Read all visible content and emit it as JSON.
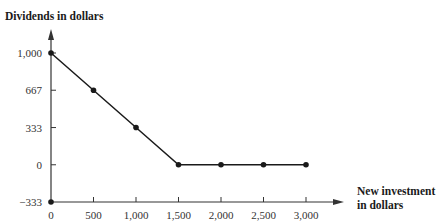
{
  "chart_data": {
    "type": "line",
    "title": "",
    "ylabel": "Dividends in dollars",
    "xlabel_lines": [
      "New investment",
      "in dollars"
    ],
    "xlabel": "New investment in dollars",
    "x": [
      0,
      500,
      1000,
      1500,
      2000,
      2500,
      3000
    ],
    "y": [
      1000,
      667,
      333,
      0,
      0,
      0,
      0
    ],
    "xticks": [
      "0",
      "500",
      "1,000",
      "1,500",
      "2,000",
      "2,500",
      "3,000"
    ],
    "yticks": [
      "1,000",
      "667",
      "333",
      "0",
      "−333"
    ],
    "ytick_values": [
      1000,
      667,
      333,
      0,
      -333
    ],
    "xlim": [
      0,
      3000
    ],
    "ylim": [
      -333,
      1000
    ],
    "origin_marker": {
      "x": 0,
      "y": -333
    },
    "grid": false,
    "legend": null,
    "line_color": "#1a1a1a"
  }
}
